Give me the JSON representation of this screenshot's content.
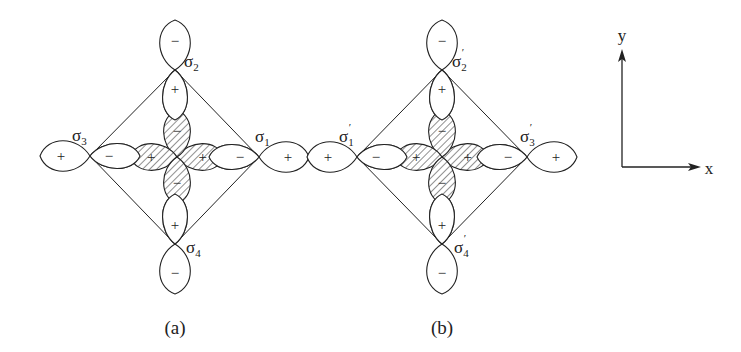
{
  "figure": {
    "panels": [
      {
        "id": "a",
        "caption": "(a)",
        "center": [
          177,
          157
        ],
        "vertices": {
          "right": {
            "pos": [
              259,
              157
            ],
            "label": "σ",
            "subscript": "1",
            "prime": false,
            "label_pos": [
              255,
              142
            ]
          },
          "top": {
            "pos": [
              175,
              70
            ],
            "label": "σ",
            "subscript": "2",
            "prime": false,
            "label_pos": [
              184,
              67
            ]
          },
          "left": {
            "pos": [
              90,
              156
            ],
            "label": "σ",
            "subscript": "3",
            "prime": false,
            "label_pos": [
              72,
              141
            ]
          },
          "bottom": {
            "pos": [
              175,
              244
            ],
            "label": "σ",
            "subscript": "4",
            "prime": false,
            "label_pos": [
              186,
              253
            ]
          }
        },
        "outer_signs": {
          "right": "+",
          "top": "−",
          "left": "+",
          "bottom": "−"
        },
        "inner_signs": {
          "right": "−",
          "top": "+",
          "left": "−",
          "bottom": "+"
        },
        "center_signs": {
          "right": "+",
          "top": "−",
          "left": "+",
          "bottom": "−"
        },
        "caption_pos": [
          175,
          327
        ]
      },
      {
        "id": "b",
        "caption": "(b)",
        "center": [
          442,
          157
        ],
        "vertices": {
          "left": {
            "pos": [
              357,
              157
            ],
            "label": "σ",
            "subscript": "1",
            "prime": true,
            "label_pos": [
              339,
              142
            ]
          },
          "top": {
            "pos": [
              442,
              70
            ],
            "label": "σ",
            "subscript": "2",
            "prime": true,
            "label_pos": [
              452,
              67
            ]
          },
          "right": {
            "pos": [
              527,
              157
            ],
            "label": "σ",
            "subscript": "3",
            "prime": true,
            "label_pos": [
              520,
              142
            ]
          },
          "bottom": {
            "pos": [
              442,
              244
            ],
            "label": "σ",
            "subscript": "4",
            "prime": true,
            "label_pos": [
              454,
              253
            ]
          }
        },
        "outer_signs": {
          "right": "+",
          "top": "−",
          "left": "+",
          "bottom": "−"
        },
        "inner_signs": {
          "right": "−",
          "top": "+",
          "left": "−",
          "bottom": "+"
        },
        "center_signs": {
          "right": "+",
          "top": "−",
          "left": "+",
          "bottom": "−"
        },
        "caption_pos": [
          442,
          327
        ]
      }
    ],
    "lobe_geometry": {
      "outer_length": 50,
      "outer_halfwidth": 16,
      "inner_length": 50,
      "inner_halfwidth": 13,
      "center_length": 47,
      "center_halfwidth": 14
    },
    "axes": {
      "origin": [
        622,
        167
      ],
      "x_tip": [
        701,
        167
      ],
      "y_tip": [
        622,
        49
      ],
      "x_label": "x",
      "y_label": "y",
      "x_label_pos": [
        709,
        168
      ],
      "y_label_pos": [
        622,
        35
      ]
    },
    "colors": {
      "stroke": "#222222",
      "background": "#ffffff"
    }
  }
}
